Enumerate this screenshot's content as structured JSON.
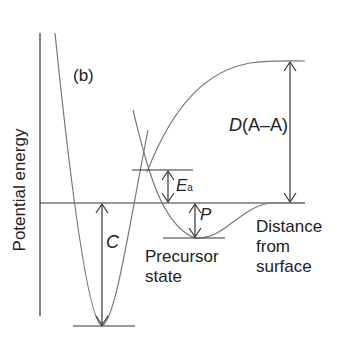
{
  "figure": {
    "panel_label": "(b)",
    "y_axis_label": "Potential energy",
    "x_axis_label_lines": [
      "Distance",
      "from",
      "surface"
    ],
    "annotations": {
      "chemisorption_depth": "C",
      "activation_energy": "E",
      "activation_energy_sub": "a",
      "precursor_depth": "P",
      "dissociation_energy_italic": "D",
      "dissociation_energy_rest": "(A–A)",
      "precursor_state_lines": [
        "Precursor",
        "state"
      ]
    },
    "colors": {
      "curve": "#777777",
      "axis": "#333333",
      "text": "#222222"
    }
  }
}
